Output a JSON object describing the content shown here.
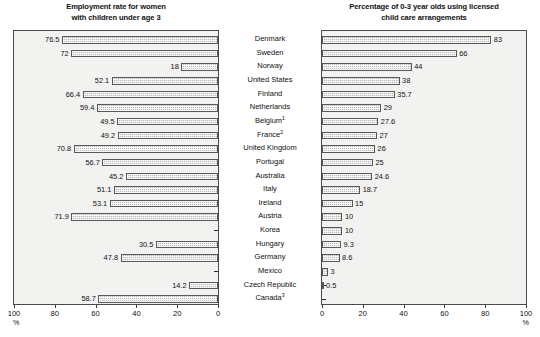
{
  "chart_data": [
    {
      "type": "bar",
      "orientation": "horizontal-right-to-left",
      "title": "Employment rate for women\nwith children under age 3",
      "xlabel": "%",
      "ylabel": "",
      "xlim": [
        100,
        0
      ],
      "ticks": [
        100,
        80,
        60,
        40,
        20,
        0
      ],
      "grid": false,
      "legend": null,
      "categories": [
        "Denmark",
        "Sweden",
        "Norway",
        "United States",
        "Finland",
        "Netherlands",
        "Belgium",
        "France",
        "United Kingdom",
        "Portugal",
        "Australia",
        "Italy",
        "Ireland",
        "Austria",
        "Korea",
        "Hungary",
        "Germany",
        "Mexico",
        "Czech Republic",
        "Canada"
      ],
      "values": [
        76.5,
        72,
        18,
        52.1,
        66.4,
        59.4,
        49.5,
        49.2,
        70.8,
        56.7,
        45.2,
        51.1,
        53.1,
        71.9,
        null,
        30.5,
        47.8,
        null,
        14.2,
        58.7
      ],
      "labels": [
        "76.5",
        "72",
        "18",
        "52.1",
        "66.4",
        "59.4",
        "49.5",
        "49.2",
        "70.8",
        "56.7",
        "45.2",
        "51.1",
        "53.1",
        "71.9",
        "",
        "30.5",
        "47.8",
        "",
        "14.2",
        "58.7"
      ]
    },
    {
      "type": "bar",
      "orientation": "horizontal-left-to-right",
      "title": "Percentage of 0-3 year olds using licensed\nchild care arrangements",
      "xlabel": "%",
      "ylabel": "",
      "xlim": [
        0,
        100
      ],
      "ticks": [
        0,
        20,
        40,
        60,
        80,
        100
      ],
      "grid": false,
      "legend": null,
      "categories": [
        "Denmark",
        "Sweden",
        "Norway",
        "United States",
        "Finland",
        "Netherlands",
        "Belgium",
        "France",
        "United Kingdom",
        "Portugal",
        "Australia",
        "Italy",
        "Ireland",
        "Austria",
        "Korea",
        "Hungary",
        "Germany",
        "Mexico",
        "Czech Republic",
        "Canada"
      ],
      "values": [
        83,
        66,
        44,
        38,
        35.7,
        29,
        27.6,
        27,
        26,
        25,
        24.6,
        18.7,
        15,
        10,
        10,
        9.3,
        8.6,
        3,
        0.5,
        null
      ],
      "labels": [
        "83",
        "66",
        "44",
        "38",
        "35.7",
        "29",
        "27.6",
        "27",
        "26",
        "25",
        "24.6",
        "18.7",
        "15",
        "10",
        "10",
        "9.3",
        "8.6",
        "3",
        "0.5",
        ""
      ]
    }
  ],
  "category_axis": {
    "labels": [
      {
        "name": "Denmark",
        "note": ""
      },
      {
        "name": "Sweden",
        "note": ""
      },
      {
        "name": "Norway",
        "note": ""
      },
      {
        "name": "United States",
        "note": ""
      },
      {
        "name": "Finland",
        "note": ""
      },
      {
        "name": "Netherlands",
        "note": ""
      },
      {
        "name": "Belgium",
        "note": "1"
      },
      {
        "name": "France",
        "note": "2"
      },
      {
        "name": "United Kingdom",
        "note": ""
      },
      {
        "name": "Portugal",
        "note": ""
      },
      {
        "name": "Australia",
        "note": ""
      },
      {
        "name": "Italy",
        "note": ""
      },
      {
        "name": "Ireland",
        "note": ""
      },
      {
        "name": "Austria",
        "note": ""
      },
      {
        "name": "Korea",
        "note": ""
      },
      {
        "name": "Hungary",
        "note": ""
      },
      {
        "name": "Germany",
        "note": ""
      },
      {
        "name": "Mexico",
        "note": ""
      },
      {
        "name": "Czech Republic",
        "note": ""
      },
      {
        "name": "Canada",
        "note": "3"
      }
    ]
  },
  "colors": {
    "bar_fill": "#b9b9b9",
    "bar_border": "#58585a",
    "plot_background": "#f2f2f0",
    "frame": "#4a4a4a",
    "text": "#111111"
  }
}
